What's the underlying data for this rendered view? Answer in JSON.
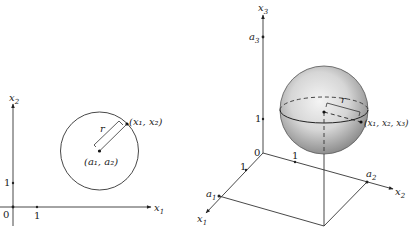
{
  "figure_2d": {
    "axis_x_label": "x",
    "axis_x_sub": "1",
    "axis_y_label": "x",
    "axis_y_sub": "2",
    "origin_label": "0",
    "tick_x_label": "1",
    "tick_y_label": "1",
    "radius_label": "r",
    "center_label": "(a₁, a₂)",
    "point_label": "(x₁, x₂)"
  },
  "figure_3d": {
    "axis_x1_label": "x",
    "axis_x1_sub": "1",
    "axis_x2_label": "x",
    "axis_x2_sub": "2",
    "axis_x3_label": "x",
    "axis_x3_sub": "3",
    "origin_label": "0",
    "tick_x1_label": "1",
    "tick_x2_label": "1",
    "tick_x3_label": "1",
    "a1_label": "a",
    "a1_sub": "1",
    "a2_label": "a",
    "a2_sub": "2",
    "a3_label": "a",
    "a3_sub": "3",
    "radius_label": "r",
    "point_label": "(x₁, x₂, x₃)"
  },
  "colors": {
    "line": "#333333",
    "sphere_light": "#f2f2f2",
    "sphere_dark": "#9a9a9a"
  }
}
